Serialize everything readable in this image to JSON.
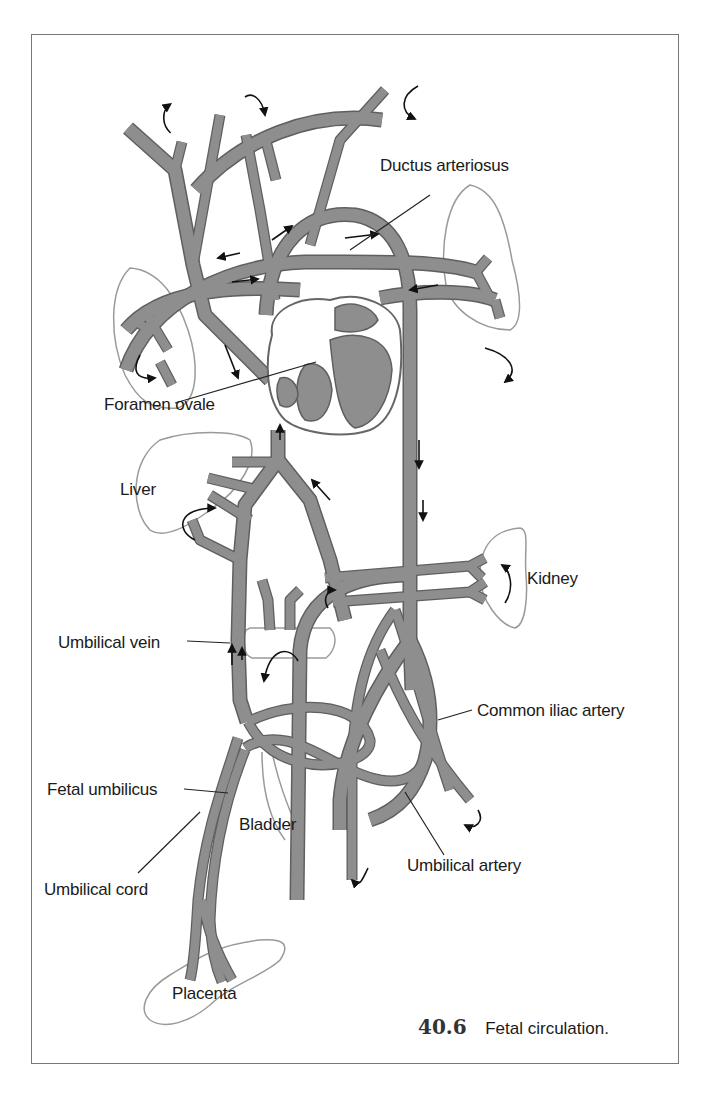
{
  "figure": {
    "number": "40.6",
    "caption": "Fetal circulation."
  },
  "labels": {
    "ductus_arteriosus": "Ductus arteriosus",
    "foramen_ovale": "Foramen ovale",
    "liver": "Liver",
    "kidney": "Kidney",
    "umbilical_vein": "Umbilical vein",
    "common_iliac_artery": "Common iliac artery",
    "fetal_umbilicus": "Fetal umbilicus",
    "bladder": "Bladder",
    "umbilical_cord": "Umbilical cord",
    "umbilical_artery": "Umbilical artery",
    "placenta": "Placenta"
  },
  "colors": {
    "vessel_fill": "#8e8e8e",
    "vessel_outline": "#5f5f5f",
    "organ_outline": "#9a9a9a",
    "frame_border": "#777777",
    "text": "#1a1a1a"
  }
}
